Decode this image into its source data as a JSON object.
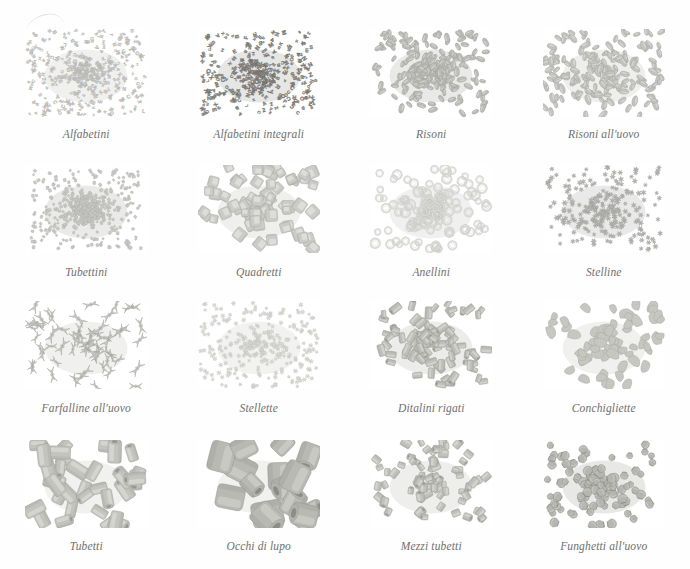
{
  "plate": {
    "background_color": "#fefefe",
    "caption_color": "#6f6f70",
    "columns": 4,
    "rows": 4
  },
  "items": [
    {
      "caption": "Alfabetini",
      "shape": "alphabet",
      "tone": "#cfcfcb",
      "density": 430,
      "size": 3.2,
      "spread": 0.96,
      "clump": 0.3
    },
    {
      "caption": "Alfabetini integrali",
      "shape": "alphabet",
      "tone": "#8d8b86",
      "density": 360,
      "size": 3.5,
      "spread": 0.94,
      "clump": 0.26
    },
    {
      "caption": "Risoni",
      "shape": "grain",
      "tone": "#bdbdb9",
      "density": 210,
      "size": 8.0,
      "spread": 0.92,
      "clump": 0.45
    },
    {
      "caption": "Risoni all'uovo",
      "shape": "grain",
      "tone": "#c3c3bf",
      "density": 175,
      "size": 8.6,
      "spread": 0.98,
      "clump": 0.3
    },
    {
      "caption": "Tubettini",
      "shape": "chip",
      "tone": "#c9c9c5",
      "density": 520,
      "size": 2.8,
      "spread": 0.9,
      "clump": 0.5
    },
    {
      "caption": "Quadretti",
      "shape": "square",
      "tone": "#cbcbc7",
      "density": 70,
      "size": 10.0,
      "spread": 0.95,
      "clump": 0.32
    },
    {
      "caption": "Anellini",
      "shape": "ring",
      "tone": "#dcdcd8",
      "density": 120,
      "size": 7.5,
      "spread": 0.92,
      "clump": 0.38
    },
    {
      "caption": "Stelline",
      "shape": "star",
      "tone": "#b9b9b5",
      "density": 230,
      "size": 5.0,
      "spread": 0.95,
      "clump": 0.4
    },
    {
      "caption": "Farfalline all'uovo",
      "shape": "bowtie",
      "tone": "#c6c6c1",
      "density": 58,
      "size": 14.0,
      "spread": 0.96,
      "clump": 0.22
    },
    {
      "caption": "Stellette",
      "shape": "star",
      "tone": "#dedeDA",
      "density": 300,
      "size": 4.2,
      "spread": 0.96,
      "clump": 0.3
    },
    {
      "caption": "Ditalini rigati",
      "shape": "tube",
      "tone": "#c0c0bb",
      "density": 90,
      "size": 9.5,
      "spread": 0.95,
      "clump": 0.34
    },
    {
      "caption": "Conchigliette",
      "shape": "shell",
      "tone": "#cacac5",
      "density": 72,
      "size": 12.0,
      "spread": 0.94,
      "clump": 0.26
    },
    {
      "caption": "Tubetti",
      "shape": "tube",
      "tone": "#c4c4bf",
      "density": 34,
      "size": 18.0,
      "spread": 0.94,
      "clump": 0.16
    },
    {
      "caption": "Occhi di lupo",
      "shape": "bigtube",
      "tone": "#b9b9b4",
      "density": 16,
      "size": 27.0,
      "spread": 0.92,
      "clump": 0.12
    },
    {
      "caption": "Mezzi tubetti",
      "shape": "shorttube",
      "tone": "#c2c2bd",
      "density": 78,
      "size": 10.5,
      "spread": 0.95,
      "clump": 0.28
    },
    {
      "caption": "Funghetti all'uovo",
      "shape": "fungus",
      "tone": "#b6b6b1",
      "density": 110,
      "size": 10.0,
      "spread": 0.94,
      "clump": 0.44
    }
  ]
}
